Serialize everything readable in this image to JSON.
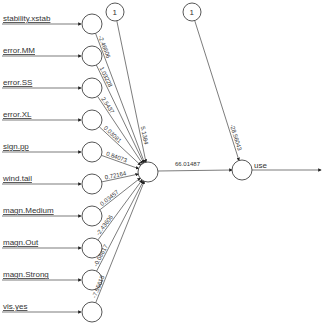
{
  "diagram": {
    "type": "neural-network",
    "inputs": [
      {
        "label": "stability.xstab",
        "weight": "-2.46606"
      },
      {
        "label": "error.MM",
        "weight": "1.03228"
      },
      {
        "label": "error.SS",
        "weight": "2.5437"
      },
      {
        "label": "error.XL",
        "weight": "0.03081"
      },
      {
        "label": "sign.pp",
        "weight": "0.84073"
      },
      {
        "label": "wind.tail",
        "weight": "0.72164"
      },
      {
        "label": "magn.Medium",
        "weight": "0.03457"
      },
      {
        "label": "magn.Out",
        "weight": "-2.43606"
      },
      {
        "label": "magn.Strong",
        "weight": "-0.08617"
      },
      {
        "label": "vis.yes",
        "weight": "-7.55613"
      }
    ],
    "bias_hidden": {
      "label": "1",
      "weight": "5.1384"
    },
    "bias_output": {
      "label": "1",
      "weight": "-28.56043"
    },
    "hidden_to_output_weight": "66.01487",
    "output": {
      "label": "use"
    }
  }
}
